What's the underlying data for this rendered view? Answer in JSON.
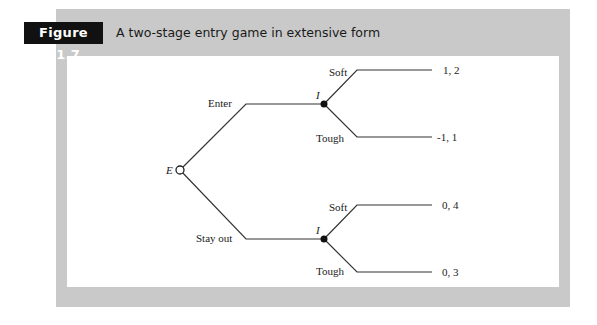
{
  "figure": {
    "label": "Figure 11.7",
    "title": "A two-stage entry game in extensive form"
  },
  "game_tree": {
    "root": {
      "player": "E",
      "node_style": "open-circle"
    },
    "entrant_actions": [
      "Enter",
      "Stay out"
    ],
    "incumbent_nodes": [
      {
        "player": "I",
        "after": "Enter",
        "node_style": "filled-circle",
        "actions": [
          {
            "label": "Soft",
            "payoff": "1, 2"
          },
          {
            "label": "Tough",
            "payoff": "-1, 1"
          }
        ]
      },
      {
        "player": "I",
        "after": "Stay out",
        "node_style": "filled-circle",
        "actions": [
          {
            "label": "Soft",
            "payoff": "0, 4"
          },
          {
            "label": "Tough",
            "payoff": "0, 3"
          }
        ]
      }
    ]
  },
  "colors": {
    "panel": "#c9c9c9",
    "label_bg": "#111111",
    "line": "#333333"
  }
}
